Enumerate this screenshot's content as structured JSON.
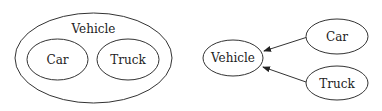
{
  "left_diagram": {
    "container": {
      "label": "Vehicle"
    },
    "children": [
      {
        "label": "Car"
      },
      {
        "label": "Truck"
      }
    ]
  },
  "right_diagram": {
    "nodes": [
      {
        "id": "vehicle",
        "label": "Vehicle"
      },
      {
        "id": "car",
        "label": "Car"
      },
      {
        "id": "truck",
        "label": "Truck"
      }
    ],
    "edges": [
      {
        "from": "car",
        "to": "vehicle"
      },
      {
        "from": "truck",
        "to": "vehicle"
      }
    ]
  },
  "colors": {
    "stroke": "#333333",
    "text": "#222222",
    "background": "#ffffff"
  }
}
